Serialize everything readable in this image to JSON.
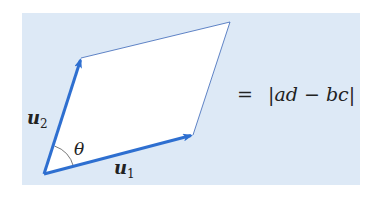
{
  "diagram": {
    "type": "parallelogram-vectors",
    "colors": {
      "panel_background": "#dde9f6",
      "parallelogram_fill": "#ffffff",
      "vector_color": "#2e6fd0",
      "edge_color": "#3a66b8",
      "text_color": "#222222"
    },
    "panel": {
      "x": 22,
      "y": 13,
      "width": 338,
      "height": 172
    },
    "origin": {
      "x": 44,
      "y": 174
    },
    "vertices": {
      "u1_tip": {
        "x": 193,
        "y": 135
      },
      "far_corner": {
        "x": 230,
        "y": 22
      },
      "u2_tip": {
        "x": 81,
        "y": 58
      }
    },
    "labels": {
      "u1": {
        "base": "u",
        "subscript": "1"
      },
      "u2": {
        "base": "u",
        "subscript": "2"
      },
      "angle": "θ",
      "equation_equals": "=",
      "equation_rhs": "|ad − bc|"
    }
  }
}
